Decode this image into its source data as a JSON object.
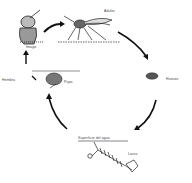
{
  "diagram": {
    "stages": [
      {
        "id": "adult",
        "label": "Adulto"
      },
      {
        "id": "eggs",
        "label": "Huevos"
      },
      {
        "id": "larva",
        "label": "Larva"
      },
      {
        "id": "pupa",
        "label": "Pupa"
      },
      {
        "id": "imago",
        "label": "Imago"
      }
    ],
    "water_surface_label": "Superficie del agua",
    "side_label": "Hembra",
    "colors": {
      "ink": "#222222",
      "background": "#ffffff"
    }
  }
}
